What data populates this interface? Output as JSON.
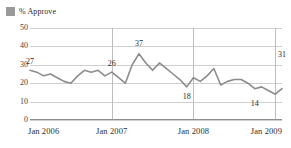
{
  "legend": {
    "label": "% Approve",
    "swatch_color": "#9a9a9a",
    "icon": "legend-swatch"
  },
  "axes": {
    "y_ticks": [
      "0",
      "10",
      "20",
      "30",
      "40",
      "50"
    ],
    "x_ticks": [
      "Jan 2006",
      "Jan 2007",
      "Jan 2008",
      "Jan 2009"
    ]
  },
  "chart_data": {
    "type": "line",
    "title": "",
    "subtitle": "",
    "xlabel": "",
    "ylabel": "",
    "ylim": [
      0,
      50
    ],
    "y_ticks": [
      0,
      10,
      20,
      30,
      40,
      50
    ],
    "grid": "horizontal-and-vertical-at-year-marks",
    "legend_position": "top-left",
    "series": [
      {
        "name": "% Approve",
        "color": "#8c8c8c",
        "x": [
          "Jan 2006",
          "Feb 2006",
          "Mar 2006",
          "Apr 2006",
          "May 2006",
          "Jun 2006",
          "Jul 2006",
          "Aug 2006",
          "Sep 2006",
          "Oct 2006",
          "Nov 2006",
          "Dec 2006",
          "Jan 2007",
          "Feb 2007",
          "Mar 2007",
          "Apr 2007",
          "May 2007",
          "Jun 2007",
          "Jul 2007",
          "Aug 2007",
          "Sep 2007",
          "Oct 2007",
          "Nov 2007",
          "Dec 2007",
          "Jan 2008",
          "Feb 2008",
          "Mar 2008",
          "Apr 2008",
          "May 2008",
          "Jun 2008",
          "Jul 2008",
          "Aug 2008",
          "Sep 2008",
          "Oct 2008",
          "Nov 2008",
          "Dec 2008",
          "Jan 2009",
          "Feb 2009"
        ],
        "values": [
          27,
          26,
          24,
          25,
          23,
          21,
          20,
          24,
          27,
          26,
          27,
          24,
          26,
          23,
          20,
          30,
          36,
          31,
          27,
          31,
          28,
          25,
          22,
          18,
          23,
          21,
          24,
          28,
          19,
          21,
          22,
          22,
          20,
          17,
          18,
          16,
          14,
          17
        ]
      }
    ],
    "annotations": [
      {
        "label": "27",
        "value": 27,
        "x": "Jan 2006"
      },
      {
        "label": "26",
        "value": 26,
        "x": "Jan 2007"
      },
      {
        "label": "37",
        "value": 37,
        "x": "May 2007"
      },
      {
        "label": "18",
        "value": 18,
        "x": "Dec 2007"
      },
      {
        "label": "14",
        "value": 14,
        "x": "Oct 2008"
      },
      {
        "label": "31",
        "value": 31,
        "x": "Feb 2009"
      }
    ]
  }
}
